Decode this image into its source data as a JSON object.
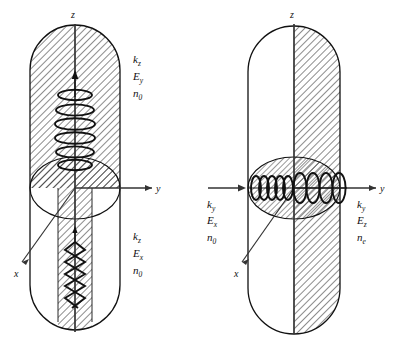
{
  "figure": {
    "background_color": "#ffffff",
    "line_color": "#111111",
    "hatch_color": "#1a1a1a",
    "panels": [
      {
        "id": "left-panel",
        "name": "propagation-along-z-axis",
        "axes": {
          "z_label": "z",
          "y_label": "y",
          "x_label": "x"
        },
        "annotations": [
          {
            "id": "upper-left-annotation",
            "k": "k",
            "k_sub": "z",
            "E": "E",
            "E_sub": "y",
            "n": "n",
            "n_sub": "0"
          },
          {
            "id": "lower-left-annotation",
            "k": "k",
            "k_sub": "z",
            "E": "E",
            "E_sub": "x",
            "n": "n",
            "n_sub": "0"
          }
        ],
        "waves": [
          {
            "id": "upper-helix",
            "type": "helix-vertical",
            "loops": 6,
            "direction": "up"
          },
          {
            "id": "lower-zigzag",
            "type": "zigzag-vertical",
            "loops": 4,
            "direction": "down"
          }
        ]
      },
      {
        "id": "right-panel",
        "name": "propagation-along-y-axis",
        "axes": {
          "z_label": "z",
          "y_label": "y",
          "x_label": "x"
        },
        "annotations": [
          {
            "id": "incident-annotation",
            "k": "k",
            "k_sub": "y",
            "E": "E",
            "E_sub": "x",
            "n": "n",
            "n_sub": "0"
          },
          {
            "id": "exit-annotation",
            "k": "k",
            "k_sub": "y",
            "E": "E",
            "E_sub": "z",
            "n": "n",
            "n_sub": "e"
          }
        ],
        "waves": [
          {
            "id": "incident-wave",
            "type": "helix-horizontal-tight",
            "loops": 7,
            "direction": "right"
          },
          {
            "id": "exit-wave",
            "type": "helix-horizontal-wide",
            "loops": 4,
            "direction": "right"
          }
        ]
      }
    ]
  }
}
